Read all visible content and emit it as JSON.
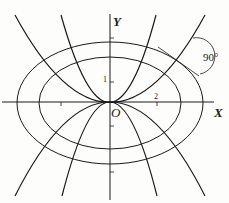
{
  "diagram": {
    "axes": {
      "x_label": "X",
      "y_label": "Y",
      "origin_label": "O"
    },
    "ticks": {
      "x_tick_label": "2",
      "y_tick_label": "1"
    },
    "annotation": {
      "angle_label": "90°"
    },
    "curves": {
      "ellipses": [
        "inner-ellipse",
        "outer-ellipse"
      ],
      "parabolas": [
        "steep-upper-parabola",
        "wide-upper-parabola",
        "steep-lower-parabola",
        "wide-lower-parabola"
      ]
    },
    "colors": {
      "line": "#1a1a1a",
      "background": "#fdfdfb"
    }
  }
}
